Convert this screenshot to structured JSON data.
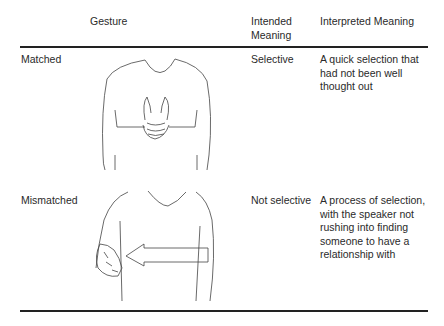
{
  "table": {
    "headers": {
      "gesture": "Gesture",
      "intended": "Intended Meaning",
      "interpreted": "Interpreted Meaning"
    },
    "rows": [
      {
        "label": "Matched",
        "figure": "hands-clasped-at-chest-illustration",
        "intended": "Selective",
        "interpreted": "A quick selection that had not been well thought out"
      },
      {
        "label": "Mismatched",
        "figure": "hand-at-side-with-left-arrow-illustration",
        "intended": "Not selective",
        "interpreted": "A process of selection, with the speaker not rushing into finding someone to have a relationship with"
      }
    ]
  }
}
